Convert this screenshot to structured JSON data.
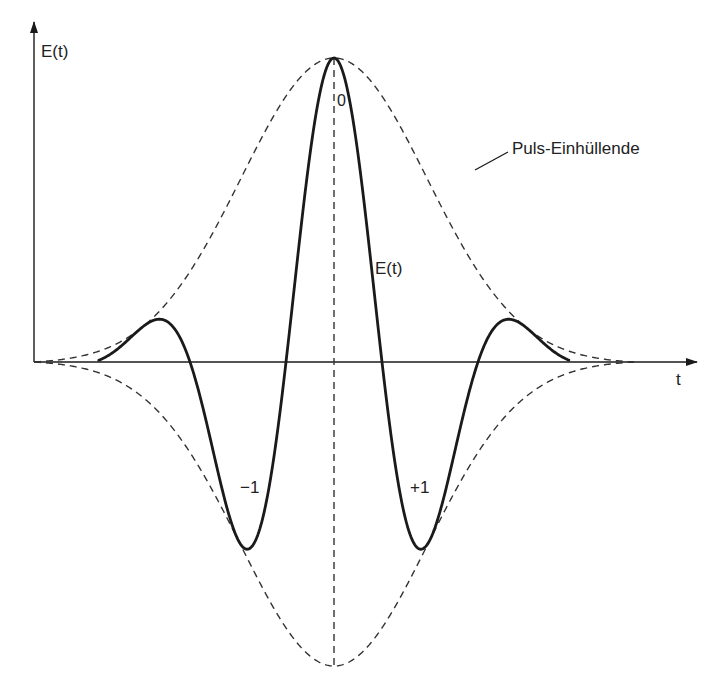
{
  "chart_data": {
    "type": "line",
    "title": "",
    "xlabel": "t",
    "ylabel": "E(t)",
    "grid": false,
    "legend": null,
    "series": [
      {
        "name": "E(t)",
        "style": "solid",
        "description": "Gaussian-enveloped carrier oscillation (ultrashort pulse field)",
        "extrema": [
          {
            "label": "",
            "x_rel": -2.0,
            "y_rel": -0.08
          },
          {
            "label": "",
            "x_rel": -1.0,
            "y_rel": 0.2
          },
          {
            "label": "-1",
            "x_rel": -0.5,
            "y_rel": -0.585
          },
          {
            "label": "0",
            "x_rel": 0.0,
            "y_rel": 1.0
          },
          {
            "label": "+1",
            "x_rel": 0.5,
            "y_rel": -0.585
          },
          {
            "label": "",
            "x_rel": 1.0,
            "y_rel": 0.2
          },
          {
            "label": "",
            "x_rel": 2.0,
            "y_rel": -0.08
          }
        ]
      },
      {
        "name": "Puls-Einhüllende",
        "style": "dashed",
        "description": "Upper and lower pulse envelope (Gaussian), symmetric about t-axis"
      }
    ]
  },
  "labels": {
    "y_axis": "E(t)",
    "x_axis": "t",
    "peak_center": "0",
    "peak_left": "−1",
    "peak_right": "+1",
    "curve": "E(t)",
    "envelope": "Puls-Einhüllende"
  },
  "colors": {
    "line": "#1a1a1a",
    "dashed": "#333333",
    "text": "#222222"
  },
  "geometry": {
    "origin_x": 34,
    "axis_y": 362,
    "center_x": 334,
    "amplitude": 304,
    "half_period": 96,
    "sigma": 93,
    "env_start_x": 34,
    "env_end_x": 634,
    "x_axis_end": 697,
    "y_axis_top": 22
  }
}
